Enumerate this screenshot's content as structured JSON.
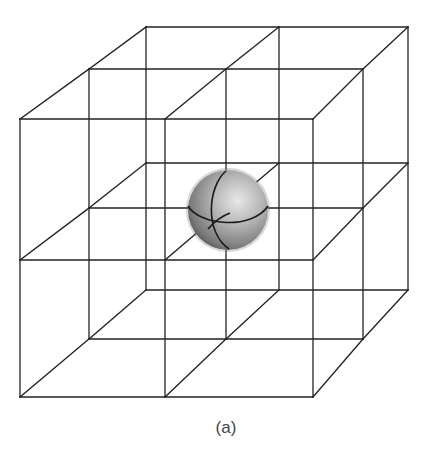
{
  "figure": {
    "caption": "(a)",
    "colors": {
      "line": "#222222",
      "sphere_light": "#e6e6e6",
      "sphere_mid": "#a8a8a8",
      "sphere_dark": "#555555",
      "caption": "#444444"
    },
    "lattice": {
      "planes": [
        {
          "name": "front",
          "xs": [
            20,
            165,
            313
          ],
          "ys": [
            119,
            260,
            397
          ]
        },
        {
          "name": "middle",
          "xs": [
            89,
            226,
            363
          ],
          "ys": [
            69,
            208,
            339
          ]
        },
        {
          "name": "back",
          "xs": [
            146,
            279,
            408
          ],
          "ys": [
            27,
            163,
            290
          ]
        }
      ]
    },
    "sphere": {
      "cx": 228,
      "cy": 210,
      "r": 40,
      "position": "central lattice node"
    }
  }
}
